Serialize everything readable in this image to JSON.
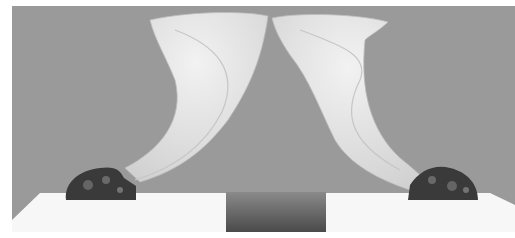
{
  "image": {
    "alt": "Photograph of two translucent white horn-shaped vessels on dark ornate mounts, displayed on white pedestals against a gray backdrop",
    "tones": {
      "backdrop": "#9a9a9a",
      "horn": "#e6e6e6",
      "horn_shadow": "#c8c8c8",
      "mount": "#3a3a3a",
      "pedestal": "#f7f7f7",
      "center_gap": "#5a5a5a"
    }
  }
}
